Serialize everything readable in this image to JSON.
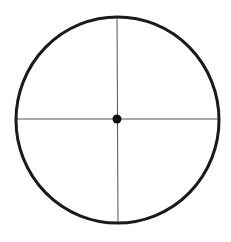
{
  "diagram": {
    "type": "circle-with-crosshair",
    "circle": {
      "cx": 117,
      "cy": 120,
      "r": 102,
      "stroke": "#1a1a1a",
      "stroke_width": 3
    },
    "crosshair": {
      "stroke": "#555555",
      "stroke_width": 1
    },
    "center_dot": {
      "r": 4.5,
      "fill": "#111111"
    }
  }
}
